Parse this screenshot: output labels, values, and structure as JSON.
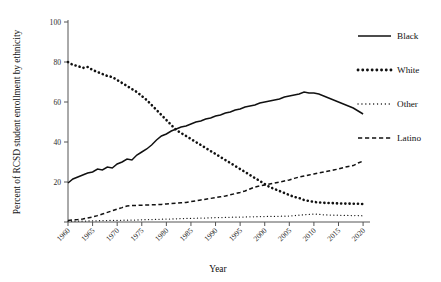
{
  "chart_data": {
    "type": "line",
    "title": "",
    "xlabel": "Year",
    "ylabel": "Percent of RCSD student enrollment by ethnicity",
    "xlim": [
      1960,
      2021
    ],
    "ylim": [
      0,
      100
    ],
    "yticks": [
      0,
      20,
      40,
      60,
      80,
      100
    ],
    "ytick_labels": [
      "",
      "20",
      "40",
      "60",
      "80",
      "100"
    ],
    "xticks": [
      1960,
      1965,
      1970,
      1975,
      1980,
      1985,
      1990,
      1995,
      2000,
      2005,
      2010,
      2015,
      2020
    ],
    "xtick_labels": [
      "1960",
      "1965",
      "1970",
      "1975",
      "1980",
      "1985",
      "1990",
      "1995",
      "2000",
      "2005",
      "2010",
      "2015",
      "2020"
    ],
    "grid": false,
    "legend_position": "right",
    "x": [
      1960,
      1961,
      1962,
      1963,
      1964,
      1965,
      1966,
      1967,
      1968,
      1969,
      1970,
      1971,
      1972,
      1973,
      1974,
      1975,
      1976,
      1977,
      1978,
      1979,
      1980,
      1981,
      1982,
      1983,
      1984,
      1985,
      1986,
      1987,
      1988,
      1989,
      1990,
      1991,
      1992,
      1993,
      1994,
      1995,
      1996,
      1997,
      1998,
      1999,
      2000,
      2001,
      2002,
      2003,
      2004,
      2005,
      2006,
      2007,
      2008,
      2009,
      2010,
      2011,
      2012,
      2013,
      2014,
      2015,
      2016,
      2017,
      2018,
      2019,
      2020
    ],
    "series": [
      {
        "name": "Black",
        "style": "solid",
        "values": [
          19.5,
          21.5,
          22.5,
          23.5,
          24.5,
          25.0,
          26.5,
          26.0,
          27.5,
          27.0,
          29.0,
          30.0,
          31.5,
          31.0,
          33.5,
          35.0,
          36.5,
          38.5,
          41.0,
          43.0,
          44.0,
          45.5,
          46.5,
          47.5,
          48.0,
          49.0,
          50.0,
          50.5,
          51.5,
          52.0,
          53.0,
          53.5,
          54.5,
          55.0,
          56.0,
          56.5,
          57.5,
          58.0,
          58.5,
          59.5,
          60.0,
          60.5,
          61.0,
          61.5,
          62.5,
          63.0,
          63.5,
          64.0,
          65.0,
          64.5,
          64.5,
          64.0,
          63.0,
          62.0,
          61.0,
          60.0,
          59.0,
          58.0,
          57.0,
          55.5,
          54.0
        ]
      },
      {
        "name": "White",
        "style": "dotted-thick",
        "values": [
          80.0,
          78.5,
          78.0,
          77.0,
          77.5,
          76.0,
          75.0,
          74.0,
          73.0,
          72.5,
          71.0,
          69.5,
          68.0,
          66.5,
          65.0,
          63.0,
          61.0,
          58.5,
          56.0,
          53.5,
          51.0,
          48.5,
          46.0,
          44.5,
          43.0,
          41.5,
          40.0,
          38.5,
          37.0,
          35.5,
          34.0,
          32.5,
          31.0,
          29.5,
          28.0,
          26.5,
          25.0,
          23.5,
          22.0,
          20.5,
          19.0,
          17.5,
          16.5,
          15.5,
          14.5,
          13.5,
          12.5,
          12.0,
          11.0,
          10.5,
          10.0,
          9.8,
          9.6,
          9.5,
          9.4,
          9.3,
          9.2,
          9.2,
          9.1,
          9.1,
          9.0
        ]
      },
      {
        "name": "Other",
        "style": "dotted-fine",
        "values": [
          0.4,
          0.4,
          0.5,
          0.5,
          0.5,
          0.6,
          0.6,
          0.7,
          0.7,
          0.8,
          0.8,
          0.9,
          0.9,
          1.0,
          1.0,
          1.1,
          1.2,
          1.2,
          1.3,
          1.4,
          1.5,
          1.5,
          1.6,
          1.7,
          1.8,
          1.8,
          1.9,
          2.0,
          2.0,
          2.1,
          2.2,
          2.2,
          2.3,
          2.4,
          2.4,
          2.5,
          2.5,
          2.6,
          2.6,
          2.7,
          2.7,
          2.8,
          2.8,
          2.9,
          2.9,
          3.0,
          3.2,
          3.4,
          3.6,
          3.8,
          4.0,
          3.8,
          3.6,
          3.5,
          3.4,
          3.4,
          3.3,
          3.3,
          3.2,
          3.2,
          3.1
        ]
      },
      {
        "name": "Latino",
        "style": "dashed",
        "values": [
          0.8,
          1.0,
          1.2,
          1.5,
          2.0,
          2.5,
          3.2,
          4.0,
          4.8,
          5.6,
          6.5,
          7.2,
          8.0,
          8.2,
          8.3,
          8.4,
          8.5,
          8.6,
          8.7,
          8.8,
          9.0,
          9.2,
          9.4,
          9.6,
          9.8,
          10.2,
          10.6,
          11.0,
          11.4,
          11.8,
          12.2,
          12.6,
          13.0,
          13.6,
          14.2,
          14.8,
          15.5,
          16.5,
          17.5,
          18.0,
          18.5,
          19.0,
          19.5,
          20.0,
          20.5,
          21.0,
          21.8,
          22.5,
          23.0,
          23.5,
          24.0,
          24.5,
          25.0,
          25.5,
          26.0,
          26.5,
          27.2,
          27.8,
          28.2,
          29.5,
          30.5
        ]
      }
    ],
    "legend": [
      {
        "label": "Black",
        "style": "solid"
      },
      {
        "label": "White",
        "style": "dotted-thick"
      },
      {
        "label": "Other",
        "style": "dotted-fine"
      },
      {
        "label": "Latino",
        "style": "dashed"
      }
    ]
  }
}
